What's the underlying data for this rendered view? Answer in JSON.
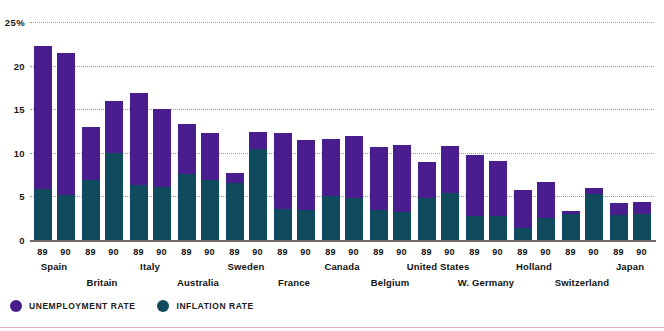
{
  "chart_data": {
    "type": "bar",
    "title": "",
    "subtitle": "",
    "xlabel": "",
    "ylabel": "",
    "ylim": [
      0,
      25
    ],
    "yticks": [
      0,
      5,
      10,
      15,
      20,
      25
    ],
    "ytick_labels": [
      "0",
      "5",
      "10",
      "15",
      "20",
      "25%"
    ],
    "grid": true,
    "stacked": true,
    "legend_position": "bottom-left",
    "categories": [
      "Spain",
      "Britain",
      "Italy",
      "Australia",
      "Sweden",
      "France",
      "Canada",
      "Belgium",
      "United States",
      "W. Germany",
      "Holland",
      "Switzerland",
      "Japan"
    ],
    "subcategories": [
      "89",
      "90"
    ],
    "series": [
      {
        "name": "UNEMPLOYMENT RATE",
        "color": "#4a1d8e",
        "values_89": [
          22.3,
          13.0,
          16.9,
          13.3,
          7.7,
          12.3,
          11.6,
          10.7,
          9.0,
          9.8,
          5.7,
          3.3,
          4.3
        ],
        "values_90": [
          21.5,
          16.0,
          15.0,
          12.3,
          12.4,
          11.5,
          11.9,
          10.9,
          10.8,
          9.1,
          6.6,
          6.0,
          4.4
        ]
      },
      {
        "name": "INFLATION RATE",
        "color": "#0f4a5e",
        "values_89": [
          5.9,
          6.9,
          6.3,
          7.6,
          6.5,
          3.5,
          5.0,
          3.4,
          4.8,
          2.8,
          1.4,
          3.0,
          2.9
        ],
        "values_90": [
          5.2,
          10.0,
          6.1,
          6.9,
          10.4,
          3.4,
          4.8,
          3.2,
          5.4,
          2.7,
          2.5,
          5.3,
          3.0
        ]
      }
    ],
    "legend": [
      {
        "label": "UNEMPLOYMENT RATE",
        "color": "#4a1d8e",
        "marker": "circle"
      },
      {
        "label": "INFLATION RATE",
        "color": "#0f4a5e",
        "marker": "circle"
      }
    ]
  },
  "axis": {
    "ticks": [
      {
        "value": 25,
        "label": "25%"
      },
      {
        "value": 20,
        "label": "20"
      },
      {
        "value": 15,
        "label": "15"
      },
      {
        "value": 10,
        "label": "10"
      },
      {
        "value": 5,
        "label": "5"
      },
      {
        "value": 0,
        "label": "0"
      }
    ]
  },
  "groups": [
    {
      "country": "Spain",
      "row": "a",
      "years": [
        "89",
        "90"
      ]
    },
    {
      "country": "Britain",
      "row": "b",
      "years": [
        "89",
        "90"
      ]
    },
    {
      "country": "Italy",
      "row": "a",
      "years": [
        "89",
        "90"
      ]
    },
    {
      "country": "Australia",
      "row": "b",
      "years": [
        "89",
        "90"
      ]
    },
    {
      "country": "Sweden",
      "row": "a",
      "years": [
        "89",
        "90"
      ]
    },
    {
      "country": "France",
      "row": "b",
      "years": [
        "89",
        "90"
      ]
    },
    {
      "country": "Canada",
      "row": "a",
      "years": [
        "89",
        "90"
      ]
    },
    {
      "country": "Belgium",
      "row": "b",
      "years": [
        "89",
        "90"
      ]
    },
    {
      "country": "United States",
      "row": "a",
      "years": [
        "89",
        "90"
      ]
    },
    {
      "country": "W. Germany",
      "row": "b",
      "years": [
        "89",
        "90"
      ]
    },
    {
      "country": "Holland",
      "row": "a",
      "years": [
        "89",
        "90"
      ]
    },
    {
      "country": "Switzerland",
      "row": "b",
      "years": [
        "89",
        "90"
      ]
    },
    {
      "country": "Japan",
      "row": "a",
      "years": [
        "89",
        "90"
      ]
    }
  ],
  "colors": {
    "unemployment": "#4a1d8e",
    "inflation": "#0f4a5e",
    "baseline": "#6f6a63",
    "gridline": "#8f8f8f",
    "rule": "#e8a9c6",
    "background": "#ffffff"
  }
}
